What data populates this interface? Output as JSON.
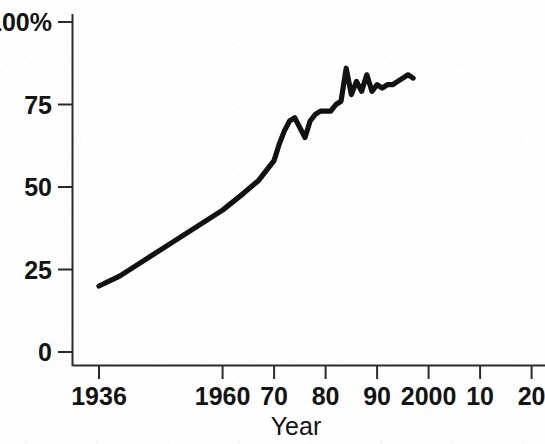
{
  "chart_data": {
    "type": "line",
    "title": "",
    "xlabel": "Year",
    "ylabel": "",
    "grid": false,
    "legend": null,
    "xlim": [
      1936,
      2020
    ],
    "ylim": [
      0,
      100
    ],
    "y_tick_values": [
      0,
      25,
      50,
      75,
      100
    ],
    "y_tick_labels": [
      "0",
      "25",
      "50",
      "75",
      "100%"
    ],
    "x_tick_values": [
      1936,
      1960,
      1970,
      1980,
      1990,
      2000,
      2010,
      2020
    ],
    "x_tick_labels": [
      "1936",
      "1960",
      "70",
      "80",
      "90",
      "2000",
      "10",
      "20"
    ],
    "series": [
      {
        "name": "percent",
        "x": [
          1936,
          1940,
          1945,
          1950,
          1955,
          1960,
          1964,
          1967,
          1969,
          1970,
          1971,
          1972,
          1973,
          1974,
          1975,
          1976,
          1977,
          1978,
          1979,
          1980,
          1981,
          1982,
          1983,
          1984,
          1985,
          1986,
          1987,
          1988,
          1989,
          1990,
          1991,
          1992,
          1993,
          1994,
          1995,
          1996,
          1997
        ],
        "values": [
          20,
          23,
          28,
          33,
          38,
          43,
          48,
          52,
          56,
          58,
          63,
          67,
          70,
          71,
          68,
          65,
          70,
          72,
          73,
          73,
          73,
          75,
          76,
          86,
          78,
          82,
          79,
          84,
          79,
          81,
          80,
          81,
          81,
          82,
          83,
          84,
          83
        ]
      }
    ]
  },
  "axis": {
    "x_title": "Year"
  },
  "colors": {
    "line": "#111111",
    "axis": "#2b2b2b",
    "background": "#fefefe",
    "text": "#131313"
  },
  "geometry": {
    "plot_left": 72,
    "plot_bottom": 366,
    "plot_top": 22,
    "plot_right": 545,
    "x_pixels_per_year": 5.15,
    "x_origin_year": 1936,
    "x_origin_px": 99,
    "y_zero_px": 352,
    "y_hundred_px": 22
  }
}
